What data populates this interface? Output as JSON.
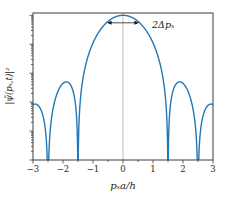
{
  "figure": {
    "background": "#ffffff"
  },
  "chart_data": {
    "type": "line",
    "title": "",
    "xlabel": "pₓa/h",
    "ylabel": "|ψ̃(pₓ,t)|²",
    "xlim": [
      -3,
      3
    ],
    "yscale": "log",
    "ylim_log10": [
      -5,
      0.08
    ],
    "grid": false,
    "legend": null,
    "x_major_ticks": [
      -3,
      -2,
      -1,
      0,
      1,
      2,
      3
    ],
    "x_tick_labels": [
      "−3",
      "−2",
      "−1",
      "0",
      "1",
      "2",
      "3"
    ],
    "x_minor_tick_step": 0.5,
    "y_tick_labels": [],
    "axvline_x": 0,
    "line_color": "#2277b5",
    "axvline_color": "#aaaaaa",
    "frame_color": "#3c3c3c",
    "tick_color": "#3c3c3c",
    "tick_label_color": "#262626",
    "formula": "y(u) = (cos(pi*u)/(1-4*u^2))^2 with u = px*a/h, normalized so y(0)=1",
    "zeros_at": [
      -2.5,
      -1.5,
      1.5,
      2.5
    ],
    "peak": {
      "x": 0,
      "value": 1
    },
    "samples": {
      "u_start": -3,
      "u_step": 0.25,
      "values": [
        0.000816,
        0.000585,
        0,
        0.001349,
        0.004444,
        0.00395,
        0,
        0.01814,
        0.1111,
        0.32,
        0.6169,
        0.8889,
        1,
        0.8889,
        0.6169,
        0.32,
        0.1111,
        0.01814,
        0,
        0.00395,
        0.004444,
        0.001349,
        0,
        0.000585,
        0.000816
      ]
    },
    "annotation": {
      "label": "2Δpₓ",
      "arrow_from_x": -0.53,
      "arrow_to_x": 0.53,
      "arrow_y_value": 0.55,
      "arrow_color": "#1a1a1a",
      "label_color": "#1a1a1a"
    }
  }
}
